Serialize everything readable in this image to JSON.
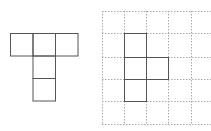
{
  "figure": {
    "left_shape": {
      "description": "T-shaped net of 5 squares",
      "cells": [
        {
          "col": 0,
          "row": 0
        },
        {
          "col": 1,
          "row": 0
        },
        {
          "col": 2,
          "row": 0
        },
        {
          "col": 1,
          "row": 1
        },
        {
          "col": 1,
          "row": 2
        }
      ],
      "origin": [
        10,
        33
      ],
      "cell_size": 22.5,
      "stroke": "#555555"
    },
    "right_grid": {
      "x_lines": [
        102,
        124,
        146,
        168,
        191
      ],
      "y_lines": [
        11,
        33,
        57,
        79,
        101,
        124
      ],
      "x_extent": [
        102,
        211
      ],
      "y_extent": [
        11,
        124
      ],
      "stroke": "#aaaaaa",
      "dash": "1.5,1.5"
    },
    "right_shape": {
      "description": "Shape of 4 squares drawn on dotted grid",
      "cells": [
        {
          "x": 124,
          "y": 33,
          "w": 22,
          "h": 24
        },
        {
          "x": 124,
          "y": 57,
          "w": 22,
          "h": 22
        },
        {
          "x": 146,
          "y": 57,
          "w": 22,
          "h": 22
        },
        {
          "x": 124,
          "y": 79,
          "w": 22,
          "h": 22
        }
      ],
      "stroke": "#555555"
    }
  }
}
